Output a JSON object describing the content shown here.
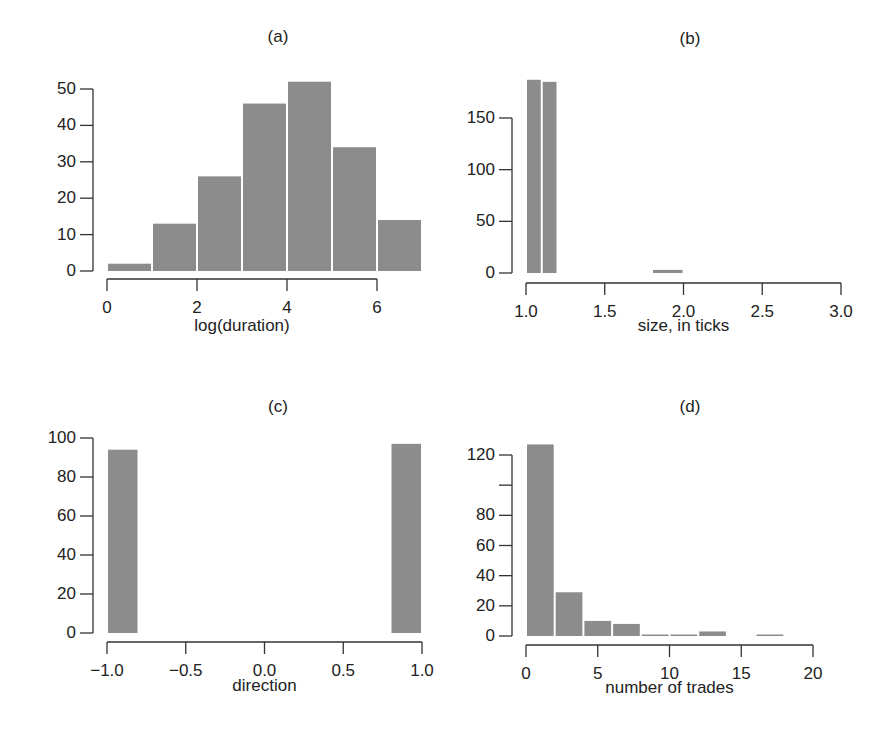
{
  "chart_data": [
    {
      "id": "a",
      "type": "bar",
      "title": "(a)",
      "xlabel": "log(duration)",
      "ylabel": "",
      "bin_edges": [
        0,
        1,
        2,
        3,
        4,
        5,
        6,
        7
      ],
      "values": [
        2,
        13,
        26,
        46,
        52,
        34,
        14
      ],
      "xticks": [
        "0",
        "2",
        "4",
        "6"
      ],
      "xtick_values": [
        0,
        2,
        4,
        6
      ],
      "yticks": [
        "0",
        "10",
        "20",
        "30",
        "40",
        "50"
      ],
      "ytick_values": [
        0,
        10,
        20,
        30,
        40,
        50
      ],
      "xlim": [
        0,
        7
      ],
      "ylim": [
        0,
        52
      ],
      "grid": false,
      "legend": null
    },
    {
      "id": "b",
      "type": "bar",
      "title": "(b)",
      "xlabel": "size, in ticks",
      "ylabel": "",
      "bin_edges": [
        1.0,
        1.1,
        1.2,
        1.3,
        1.4,
        1.5,
        1.6,
        1.7,
        1.8,
        1.9,
        2.0
      ],
      "bins": [
        {
          "x0": 1.0,
          "x1": 1.1,
          "value": 187
        },
        {
          "x0": 1.1,
          "x1": 1.2,
          "value": 185
        },
        {
          "x0": 1.8,
          "x1": 2.0,
          "value": 3
        }
      ],
      "xticks": [
        "1.0",
        "1.5",
        "2.0",
        "2.5",
        "3.0"
      ],
      "xtick_values": [
        1.0,
        1.5,
        2.0,
        2.5,
        3.0
      ],
      "yticks": [
        "0",
        "50",
        "100",
        "150"
      ],
      "ytick_values": [
        0,
        50,
        100,
        150
      ],
      "xlim": [
        1.0,
        3.0
      ],
      "ylim": [
        0,
        187
      ],
      "grid": false,
      "legend": null
    },
    {
      "id": "c",
      "type": "bar",
      "title": "(c)",
      "xlabel": "direction",
      "ylabel": "",
      "bins": [
        {
          "x0": -1.0,
          "x1": -0.8,
          "value": 94
        },
        {
          "x0": 0.8,
          "x1": 1.0,
          "value": 97
        }
      ],
      "xticks": [
        "−1.0",
        "−0.5",
        "0.0",
        "0.5",
        "1.0"
      ],
      "xtick_values": [
        -1.0,
        -0.5,
        0.0,
        0.5,
        1.0
      ],
      "yticks": [
        "0",
        "20",
        "40",
        "60",
        "80",
        "100"
      ],
      "ytick_values": [
        0,
        20,
        40,
        60,
        80,
        100
      ],
      "xlim": [
        -1.0,
        1.0
      ],
      "ylim": [
        0,
        100
      ],
      "grid": false,
      "legend": null
    },
    {
      "id": "d",
      "type": "bar",
      "title": "(d)",
      "xlabel": "number of trades",
      "ylabel": "",
      "bin_edges": [
        0,
        2,
        4,
        6,
        8,
        10,
        12,
        14,
        16,
        18
      ],
      "values": [
        127,
        29,
        10,
        8,
        1,
        0.5,
        3,
        0,
        0.3
      ],
      "xticks": [
        "0",
        "5",
        "10",
        "15",
        "20"
      ],
      "xtick_values": [
        0,
        5,
        10,
        15,
        20
      ],
      "yticks": [
        "0",
        "20",
        "40",
        "60",
        "80",
        "",
        "120"
      ],
      "ytick_values": [
        0,
        20,
        40,
        60,
        80,
        100,
        120
      ],
      "xlim": [
        0,
        20
      ],
      "ylim": [
        0,
        127
      ],
      "grid": false,
      "legend": null
    }
  ],
  "layout": {
    "bar_color": "#8c8c8c",
    "bar_edge": "#ffffff",
    "axis_color": "#333333"
  }
}
